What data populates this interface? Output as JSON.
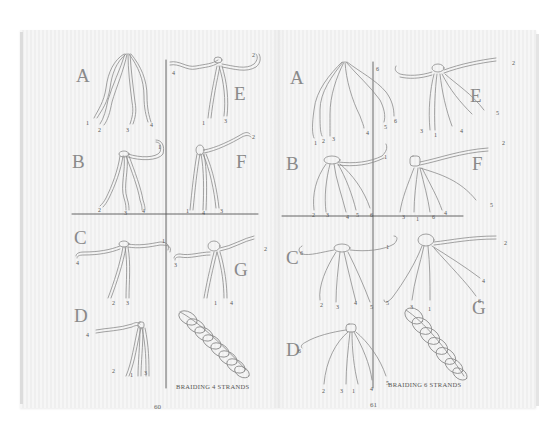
{
  "book": {
    "left_page": {
      "page_number": "60",
      "caption": "BRAIDING 4 STRANDS",
      "steps": [
        {
          "letter": "A",
          "strand_labels": [
            "1",
            "2",
            "3",
            "4"
          ]
        },
        {
          "letter": "B",
          "strand_labels": [
            "1",
            "2",
            "3",
            "4"
          ]
        },
        {
          "letter": "C",
          "strand_labels": [
            "1",
            "4",
            "2",
            "3"
          ]
        },
        {
          "letter": "D",
          "strand_labels": [
            "4",
            "2",
            "1",
            "3"
          ]
        },
        {
          "letter": "E",
          "strand_labels": [
            "2",
            "4",
            "1",
            "3"
          ]
        },
        {
          "letter": "F",
          "strand_labels": [
            "2",
            "1",
            "4",
            "3"
          ]
        },
        {
          "letter": "G",
          "strand_labels": [
            "2",
            "3",
            "1",
            "4"
          ]
        }
      ]
    },
    "right_page": {
      "page_number": "61",
      "caption": "BRAIDING 6 STRANDS",
      "steps": [
        {
          "letter": "A",
          "strand_labels": [
            "1",
            "2",
            "3",
            "4",
            "5",
            "6"
          ]
        },
        {
          "letter": "B",
          "strand_labels": [
            "1",
            "2",
            "3",
            "4",
            "5",
            "6"
          ]
        },
        {
          "letter": "C",
          "strand_labels": [
            "6",
            "1",
            "2",
            "3",
            "4",
            "5"
          ]
        },
        {
          "letter": "D",
          "strand_labels": [
            "6",
            "2",
            "3",
            "1",
            "4",
            "5"
          ]
        },
        {
          "letter": "E",
          "strand_labels": [
            "6",
            "2",
            "5",
            "3",
            "1",
            "4"
          ]
        },
        {
          "letter": "F",
          "strand_labels": [
            "2",
            "5",
            "3",
            "1",
            "6",
            "4"
          ]
        },
        {
          "letter": "G",
          "strand_labels": [
            "2",
            "4",
            "5",
            "6",
            "3",
            "1"
          ]
        }
      ]
    }
  }
}
